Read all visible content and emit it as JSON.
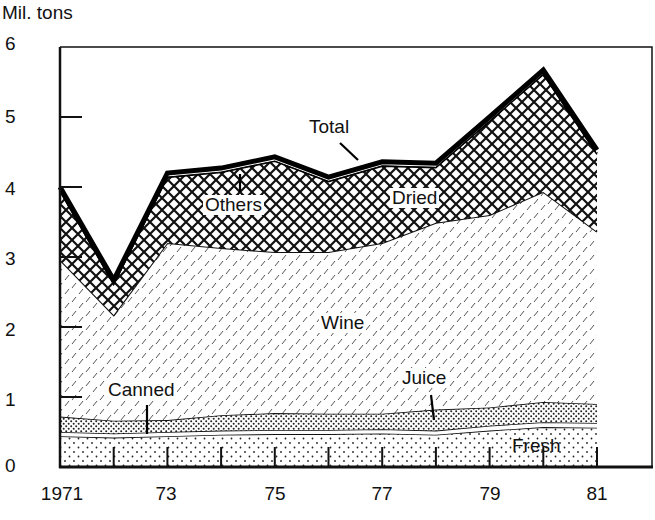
{
  "chart_data": {
    "type": "area",
    "stacked": true,
    "title": "",
    "ylabel": "Mil. tons",
    "xlabel": "",
    "ylim": [
      0,
      6
    ],
    "xlim": [
      1971,
      1982
    ],
    "grid": false,
    "legend": "inline labels",
    "x": [
      1971,
      1972,
      1973,
      1974,
      1975,
      1976,
      1977,
      1978,
      1979,
      1980,
      1981
    ],
    "x_tick_labels": [
      "1971",
      "73",
      "75",
      "77",
      "79",
      "81"
    ],
    "x_tick_positions": [
      1971,
      1973,
      1975,
      1977,
      1979,
      1981
    ],
    "y_tick_labels": [
      "0",
      "1",
      "2",
      "3",
      "4",
      "5",
      "6"
    ],
    "series": [
      {
        "name": "Fresh",
        "pattern": "sparse-dots",
        "values": [
          0.44,
          0.42,
          0.44,
          0.46,
          0.47,
          0.47,
          0.48,
          0.46,
          0.52,
          0.57,
          0.56
        ]
      },
      {
        "name": "Canned",
        "pattern": "white",
        "values": [
          0.06,
          0.06,
          0.06,
          0.06,
          0.06,
          0.06,
          0.06,
          0.06,
          0.07,
          0.07,
          0.07
        ]
      },
      {
        "name": "Juice",
        "pattern": "dense-dots",
        "values": [
          0.22,
          0.18,
          0.17,
          0.22,
          0.24,
          0.23,
          0.22,
          0.3,
          0.26,
          0.29,
          0.27
        ]
      },
      {
        "name": "Wine",
        "pattern": "diagonal-dashes",
        "values": [
          2.24,
          1.51,
          2.53,
          2.39,
          2.3,
          2.31,
          2.44,
          2.67,
          2.75,
          3.0,
          2.46
        ]
      },
      {
        "name": "Dried",
        "pattern": "crosshatch",
        "values": [
          0.99,
          0.45,
          0.95,
          1.09,
          1.31,
          1.02,
          1.11,
          0.8,
          1.35,
          1.69,
          1.12
        ]
      },
      {
        "name": "Others",
        "pattern": "white",
        "values": [
          0.05,
          0.05,
          0.05,
          0.05,
          0.05,
          0.05,
          0.05,
          0.05,
          0.05,
          0.05,
          0.05
        ]
      }
    ],
    "total": {
      "name": "Total",
      "values": [
        4.0,
        2.67,
        4.2,
        4.27,
        4.43,
        4.14,
        4.36,
        4.34,
        5.0,
        5.67,
        4.53
      ]
    },
    "annotations": [
      {
        "text": "Total",
        "x": 1975.8,
        "y": 4.8
      },
      {
        "text": "Others",
        "x": 1974.3,
        "y": 3.75
      },
      {
        "text": "Dried",
        "x": 1977.7,
        "y": 3.8
      },
      {
        "text": "Wine",
        "x": 1976.0,
        "y": 2.0
      },
      {
        "text": "Canned",
        "x": 1972.6,
        "y": 1.1
      },
      {
        "text": "Juice",
        "x": 1977.8,
        "y": 1.2
      },
      {
        "text": "Fresh",
        "x": 1980.0,
        "y": 0.3
      }
    ]
  },
  "labels": {
    "ylabel": "Mil. tons",
    "total": "Total",
    "others": "Others",
    "dried": "Dried",
    "wine": "Wine",
    "canned": "Canned",
    "juice": "Juice",
    "fresh": "Fresh"
  },
  "axis": {
    "y": [
      "0",
      "1",
      "2",
      "3",
      "4",
      "5",
      "6"
    ],
    "x": [
      "1971",
      "73",
      "75",
      "77",
      "79",
      "81"
    ]
  }
}
